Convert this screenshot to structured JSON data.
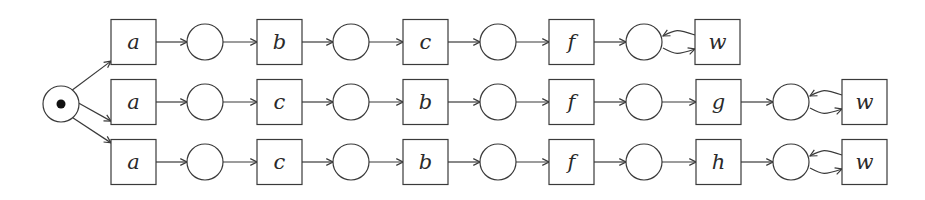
{
  "diagram": {
    "type": "petri-net",
    "colors": {
      "stroke": "#3a3a3a",
      "token": "#111111",
      "background": "#ffffff"
    },
    "initial_place": {
      "id": "p0",
      "cx": 61,
      "cy": 104,
      "r": 18,
      "tokens": 1
    },
    "rows": [
      {
        "id": "row1",
        "cy": 42,
        "sequence": [
          "a",
          "b",
          "c",
          "f",
          "w"
        ],
        "transitions": [
          {
            "label": "a",
            "x": 111
          },
          {
            "label": "b",
            "x": 257
          },
          {
            "label": "c",
            "x": 403
          },
          {
            "label": "f",
            "x": 549
          },
          {
            "label": "w",
            "x": 695,
            "self_loop": true
          }
        ],
        "places": [
          205,
          351,
          498,
          644
        ]
      },
      {
        "id": "row2",
        "cy": 102,
        "sequence": [
          "a",
          "c",
          "b",
          "f",
          "g",
          "w"
        ],
        "transitions": [
          {
            "label": "a",
            "x": 111
          },
          {
            "label": "c",
            "x": 257
          },
          {
            "label": "b",
            "x": 403
          },
          {
            "label": "f",
            "x": 549
          },
          {
            "label": "g",
            "x": 696
          },
          {
            "label": "w",
            "x": 842,
            "self_loop": true
          }
        ],
        "places": [
          205,
          351,
          498,
          644,
          791
        ]
      },
      {
        "id": "row3",
        "cy": 162,
        "sequence": [
          "a",
          "c",
          "b",
          "f",
          "h",
          "w"
        ],
        "transitions": [
          {
            "label": "a",
            "x": 111
          },
          {
            "label": "c",
            "x": 257
          },
          {
            "label": "b",
            "x": 403
          },
          {
            "label": "f",
            "x": 549
          },
          {
            "label": "h",
            "x": 696
          },
          {
            "label": "w",
            "x": 842,
            "self_loop": true
          }
        ],
        "places": [
          205,
          351,
          498,
          644,
          791
        ]
      }
    ],
    "transition_size": 45,
    "place_radius": 18
  }
}
